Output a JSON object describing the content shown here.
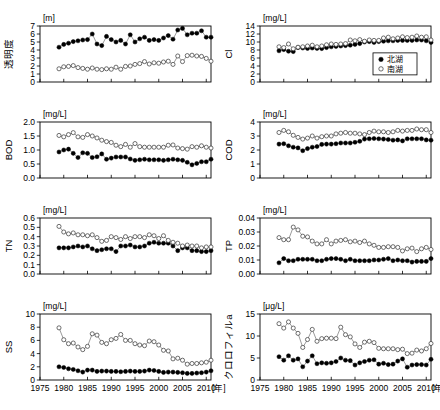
{
  "figure": {
    "series_names": {
      "north": "北湖",
      "south": "南湖"
    },
    "legend": {
      "items": [
        "北湖",
        "南湖"
      ],
      "position": "panel-cl-bottom-right"
    },
    "x_axis": {
      "label": "年",
      "min": 1975,
      "max": 2011,
      "ticks": [
        1975,
        1980,
        1985,
        1990,
        1995,
        2000,
        2005,
        2010
      ],
      "tick_labels": [
        "1975",
        "1980",
        "1985",
        "1990",
        "1995",
        "2000",
        "2005",
        "2010"
      ]
    }
  },
  "chart_data": [
    {
      "id": "transparency",
      "type": "line",
      "title": "",
      "ylabel": "透明度",
      "unit": "[m]",
      "xlabel": "年",
      "ylim": [
        0,
        7
      ],
      "yticks": [
        0,
        1,
        2,
        3,
        4,
        5,
        6,
        7
      ],
      "ytick_labels": [
        "0",
        "1",
        "2",
        "3",
        "4",
        "5",
        "6",
        "7"
      ],
      "x": [
        1979,
        1980,
        1981,
        1982,
        1983,
        1984,
        1985,
        1986,
        1987,
        1988,
        1989,
        1990,
        1991,
        1992,
        1993,
        1994,
        1995,
        1996,
        1997,
        1998,
        1999,
        2000,
        2001,
        2002,
        2003,
        2004,
        2005,
        2006,
        2007,
        2008,
        2009,
        2010,
        2011
      ],
      "series": [
        {
          "name": "北湖",
          "marker": "filled",
          "values": [
            4.35,
            4.7,
            4.85,
            5.05,
            5.15,
            5.25,
            5.3,
            6.0,
            4.75,
            4.55,
            5.7,
            5.3,
            5.0,
            5.2,
            4.75,
            5.9,
            5.0,
            5.4,
            5.6,
            5.2,
            5.3,
            5.2,
            5.5,
            5.8,
            5.35,
            6.5,
            6.7,
            5.9,
            6.1,
            6.1,
            6.4,
            5.6,
            5.6
          ]
        },
        {
          "name": "南湖",
          "marker": "open",
          "values": [
            1.65,
            1.9,
            1.95,
            2.05,
            1.8,
            1.7,
            1.6,
            1.75,
            1.6,
            1.55,
            1.65,
            1.6,
            1.85,
            1.6,
            1.95,
            2.0,
            2.2,
            2.3,
            2.55,
            2.25,
            2.4,
            2.35,
            2.5,
            2.6,
            2.2,
            3.25,
            2.55,
            3.3,
            3.35,
            3.25,
            3.2,
            2.95,
            2.6
          ]
        }
      ]
    },
    {
      "id": "cl",
      "type": "line",
      "ylabel": "Cl",
      "unit": "[mg/L]",
      "xlabel": "年",
      "ylim": [
        0,
        14
      ],
      "yticks": [
        0,
        2,
        4,
        6,
        8,
        10,
        12,
        14
      ],
      "ytick_labels": [
        "0",
        "2",
        "4",
        "6",
        "8",
        "10",
        "12",
        "14"
      ],
      "x": [
        1979,
        1980,
        1981,
        1982,
        1983,
        1984,
        1985,
        1986,
        1987,
        1988,
        1989,
        1990,
        1991,
        1992,
        1993,
        1994,
        1995,
        1996,
        1997,
        1998,
        1999,
        2000,
        2001,
        2002,
        2003,
        2004,
        2005,
        2006,
        2007,
        2008,
        2009,
        2010,
        2011
      ],
      "series": [
        {
          "name": "北湖",
          "marker": "filled",
          "values": [
            7.8,
            8.1,
            7.7,
            7.6,
            8.6,
            8.5,
            8.4,
            8.5,
            8.4,
            8.35,
            8.6,
            8.8,
            8.9,
            9.0,
            9.1,
            9.2,
            9.4,
            9.6,
            10.0,
            10.1,
            9.9,
            10.1,
            10.2,
            10.3,
            10.3,
            10.4,
            10.4,
            10.4,
            10.4,
            10.5,
            10.5,
            10.3,
            9.9
          ]
        },
        {
          "name": "南湖",
          "marker": "open",
          "values": [
            8.8,
            8.6,
            9.5,
            8.3,
            8.7,
            8.8,
            9.0,
            9.2,
            8.8,
            9.0,
            9.3,
            9.5,
            9.4,
            9.5,
            9.6,
            10.5,
            10.3,
            10.6,
            10.2,
            10.5,
            10.4,
            10.4,
            11.0,
            11.2,
            10.8,
            11.0,
            11.3,
            11.1,
            11.2,
            11.5,
            11.2,
            11.3,
            10.5
          ]
        }
      ]
    },
    {
      "id": "bod",
      "type": "line",
      "ylabel": "BOD",
      "unit": "[mg/L]",
      "xlabel": "年",
      "ylim": [
        0.0,
        2.0
      ],
      "yticks": [
        0.0,
        0.5,
        1.0,
        1.5,
        2.0
      ],
      "ytick_labels": [
        "0.0",
        "0.5",
        "1.0",
        "1.5",
        "2.0"
      ],
      "x": [
        1979,
        1980,
        1981,
        1982,
        1983,
        1984,
        1985,
        1986,
        1987,
        1988,
        1989,
        1990,
        1991,
        1992,
        1993,
        1994,
        1995,
        1996,
        1997,
        1998,
        1999,
        2000,
        2001,
        2002,
        2003,
        2004,
        2005,
        2006,
        2007,
        2008,
        2009,
        2010,
        2011
      ],
      "series": [
        {
          "name": "北湖",
          "marker": "filled",
          "values": [
            0.93,
            1.0,
            1.03,
            0.88,
            0.73,
            0.9,
            0.88,
            0.73,
            0.76,
            0.86,
            0.67,
            0.71,
            0.75,
            0.75,
            0.75,
            0.68,
            0.63,
            0.65,
            0.67,
            0.65,
            0.65,
            0.65,
            0.63,
            0.65,
            0.67,
            0.65,
            0.63,
            0.56,
            0.47,
            0.52,
            0.58,
            0.58,
            0.67
          ]
        },
        {
          "name": "南湖",
          "marker": "open",
          "values": [
            1.52,
            1.47,
            1.55,
            1.62,
            1.47,
            1.45,
            1.55,
            1.5,
            1.43,
            1.35,
            1.3,
            1.27,
            1.17,
            1.12,
            1.2,
            1.1,
            1.23,
            1.12,
            1.1,
            1.1,
            1.1,
            1.1,
            1.1,
            1.17,
            1.18,
            1.07,
            1.05,
            1.03,
            1.12,
            1.1,
            1.15,
            1.1,
            1.07
          ]
        }
      ]
    },
    {
      "id": "cod",
      "type": "line",
      "ylabel": "COD",
      "unit": "[mg/L]",
      "xlabel": "年",
      "ylim": [
        0,
        4
      ],
      "yticks": [
        0,
        1,
        2,
        3,
        4
      ],
      "ytick_labels": [
        "0",
        "1",
        "2",
        "3",
        "4"
      ],
      "x": [
        1979,
        1980,
        1981,
        1982,
        1983,
        1984,
        1985,
        1986,
        1987,
        1988,
        1989,
        1990,
        1991,
        1992,
        1993,
        1994,
        1995,
        1996,
        1997,
        1998,
        1999,
        2000,
        2001,
        2002,
        2003,
        2004,
        2005,
        2006,
        2007,
        2008,
        2009,
        2010,
        2011
      ],
      "series": [
        {
          "name": "北湖",
          "marker": "filled",
          "values": [
            2.42,
            2.45,
            2.3,
            2.2,
            2.15,
            1.95,
            2.1,
            2.2,
            2.25,
            2.4,
            2.42,
            2.42,
            2.45,
            2.5,
            2.5,
            2.5,
            2.55,
            2.62,
            2.78,
            2.8,
            2.82,
            2.8,
            2.78,
            2.75,
            2.7,
            2.72,
            2.65,
            2.8,
            2.8,
            2.8,
            2.8,
            2.72,
            2.7
          ]
        },
        {
          "name": "南湖",
          "marker": "open",
          "values": [
            3.25,
            3.4,
            3.3,
            3.05,
            2.9,
            2.78,
            2.85,
            3.0,
            2.85,
            2.95,
            3.0,
            3.0,
            3.15,
            3.2,
            3.25,
            3.2,
            3.2,
            3.15,
            3.1,
            3.25,
            3.35,
            3.3,
            3.3,
            3.25,
            3.3,
            3.4,
            3.35,
            3.4,
            3.4,
            3.5,
            3.45,
            3.45,
            3.25
          ]
        }
      ]
    },
    {
      "id": "tn",
      "type": "line",
      "ylabel": "TN",
      "unit": "[mg/L]",
      "xlabel": "年",
      "ylim": [
        0.0,
        0.6
      ],
      "yticks": [
        0.0,
        0.1,
        0.2,
        0.3,
        0.4,
        0.5,
        0.6
      ],
      "ytick_labels": [
        "0.0",
        "0.1",
        "0.2",
        "0.3",
        "0.4",
        "0.5",
        "0.6"
      ],
      "x": [
        1979,
        1980,
        1981,
        1982,
        1983,
        1984,
        1985,
        1986,
        1987,
        1988,
        1989,
        1990,
        1991,
        1992,
        1993,
        1994,
        1995,
        1996,
        1997,
        1998,
        1999,
        2000,
        2001,
        2002,
        2003,
        2004,
        2005,
        2006,
        2007,
        2008,
        2009,
        2010,
        2011
      ],
      "series": [
        {
          "name": "北湖",
          "marker": "filled",
          "values": [
            0.28,
            0.28,
            0.28,
            0.29,
            0.3,
            0.29,
            0.3,
            0.27,
            0.25,
            0.26,
            0.27,
            0.27,
            0.24,
            0.3,
            0.3,
            0.31,
            0.29,
            0.29,
            0.3,
            0.33,
            0.34,
            0.33,
            0.33,
            0.33,
            0.3,
            0.25,
            0.28,
            0.28,
            0.25,
            0.25,
            0.24,
            0.24,
            0.25
          ]
        },
        {
          "name": "南湖",
          "marker": "open",
          "values": [
            0.51,
            0.45,
            0.43,
            0.44,
            0.42,
            0.42,
            0.41,
            0.42,
            0.39,
            0.35,
            0.36,
            0.4,
            0.39,
            0.37,
            0.4,
            0.38,
            0.4,
            0.4,
            0.39,
            0.42,
            0.41,
            0.38,
            0.41,
            0.36,
            0.34,
            0.33,
            0.3,
            0.31,
            0.3,
            0.3,
            0.28,
            0.29,
            0.29
          ]
        }
      ]
    },
    {
      "id": "tp",
      "type": "line",
      "ylabel": "TP",
      "unit": "[mg/L]",
      "xlabel": "年",
      "ylim": [
        0.0,
        0.04
      ],
      "yticks": [
        0.0,
        0.01,
        0.02,
        0.03,
        0.04
      ],
      "ytick_labels": [
        "0.00",
        "0.01",
        "0.02",
        "0.03",
        "0.04"
      ],
      "x": [
        1979,
        1980,
        1981,
        1982,
        1983,
        1984,
        1985,
        1986,
        1987,
        1988,
        1989,
        1990,
        1991,
        1992,
        1993,
        1994,
        1995,
        1996,
        1997,
        1998,
        1999,
        2000,
        2001,
        2002,
        2003,
        2004,
        2005,
        2006,
        2007,
        2008,
        2009,
        2010,
        2011
      ],
      "series": [
        {
          "name": "北湖",
          "marker": "filled",
          "values": [
            0.008,
            0.011,
            0.0095,
            0.0095,
            0.0105,
            0.0105,
            0.0105,
            0.0105,
            0.0095,
            0.0095,
            0.0105,
            0.011,
            0.011,
            0.0105,
            0.0095,
            0.0105,
            0.0095,
            0.0095,
            0.0095,
            0.0095,
            0.01,
            0.01,
            0.0105,
            0.011,
            0.0095,
            0.01,
            0.0095,
            0.0095,
            0.0085,
            0.009,
            0.009,
            0.009,
            0.011
          ]
        },
        {
          "name": "南湖",
          "marker": "open",
          "values": [
            0.026,
            0.0245,
            0.0245,
            0.0335,
            0.0315,
            0.027,
            0.0265,
            0.0235,
            0.0215,
            0.0215,
            0.0245,
            0.0215,
            0.0235,
            0.024,
            0.0245,
            0.023,
            0.0235,
            0.0225,
            0.0235,
            0.0215,
            0.0205,
            0.019,
            0.019,
            0.0195,
            0.0195,
            0.019,
            0.0165,
            0.018,
            0.0185,
            0.016,
            0.018,
            0.019,
            0.0175
          ]
        }
      ]
    },
    {
      "id": "ss",
      "type": "line",
      "ylabel": "SS",
      "unit": "[mg/L]",
      "xlabel": "年",
      "ylim": [
        0,
        10
      ],
      "yticks": [
        0,
        2,
        4,
        6,
        8,
        10
      ],
      "ytick_labels": [
        "0",
        "2",
        "4",
        "6",
        "8",
        "10"
      ],
      "x": [
        1979,
        1980,
        1981,
        1982,
        1983,
        1984,
        1985,
        1986,
        1987,
        1988,
        1989,
        1990,
        1991,
        1992,
        1993,
        1994,
        1995,
        1996,
        1997,
        1998,
        1999,
        2000,
        2001,
        2002,
        2003,
        2004,
        2005,
        2006,
        2007,
        2008,
        2009,
        2010,
        2011
      ],
      "series": [
        {
          "name": "北湖",
          "marker": "filled",
          "values": [
            2.0,
            1.9,
            1.7,
            1.6,
            1.4,
            1.2,
            1.5,
            1.5,
            1.3,
            1.35,
            1.35,
            1.3,
            1.3,
            1.25,
            1.3,
            1.35,
            1.3,
            1.3,
            1.35,
            1.5,
            1.45,
            1.3,
            1.15,
            1.2,
            1.2,
            1.15,
            1.1,
            1.0,
            1.0,
            1.05,
            1.1,
            1.2,
            1.4
          ]
        },
        {
          "name": "南湖",
          "marker": "open",
          "values": [
            7.9,
            6.1,
            5.5,
            5.6,
            5.0,
            4.6,
            5.1,
            7.0,
            6.8,
            5.7,
            5.5,
            6.1,
            6.3,
            6.9,
            6.0,
            6.0,
            5.5,
            5.3,
            5.2,
            5.9,
            5.8,
            5.3,
            4.5,
            4.4,
            3.2,
            3.3,
            3.0,
            2.4,
            2.5,
            2.5,
            2.6,
            2.7,
            3.0
          ]
        }
      ]
    },
    {
      "id": "chlorophyll",
      "type": "line",
      "ylabel": "クロロフィルa",
      "unit": "[μg/L]",
      "xlabel": "年",
      "ylim": [
        0,
        15
      ],
      "yticks": [
        0,
        5,
        10,
        15
      ],
      "ytick_labels": [
        "0",
        "5",
        "10",
        "15"
      ],
      "x": [
        1979,
        1980,
        1981,
        1982,
        1983,
        1984,
        1985,
        1986,
        1987,
        1988,
        1989,
        1990,
        1991,
        1992,
        1993,
        1994,
        1995,
        1996,
        1997,
        1998,
        1999,
        2000,
        2001,
        2002,
        2003,
        2004,
        2005,
        2006,
        2007,
        2008,
        2009,
        2010,
        2011
      ],
      "series": [
        {
          "name": "北湖",
          "marker": "filled",
          "values": [
            5.3,
            4.5,
            5.5,
            4.5,
            4.8,
            3.0,
            4.3,
            5.5,
            3.7,
            3.9,
            3.8,
            3.9,
            4.2,
            5.0,
            4.5,
            4.4,
            3.4,
            3.9,
            4.2,
            4.5,
            4.6,
            3.6,
            3.8,
            3.5,
            3.6,
            4.3,
            4.8,
            2.9,
            3.4,
            3.5,
            3.5,
            3.4,
            4.7
          ]
        },
        {
          "name": "南湖",
          "marker": "open",
          "values": [
            12.8,
            11.8,
            13.2,
            11.8,
            10.6,
            7.4,
            9.2,
            11.5,
            8.8,
            9.4,
            9.5,
            9.5,
            9.4,
            12.0,
            10.3,
            9.8,
            8.2,
            7.4,
            8.6,
            8.8,
            8.5,
            7.2,
            7.1,
            7.1,
            7.1,
            6.9,
            7.0,
            6.0,
            6.1,
            6.8,
            6.6,
            7.1,
            8.3
          ]
        }
      ]
    }
  ]
}
